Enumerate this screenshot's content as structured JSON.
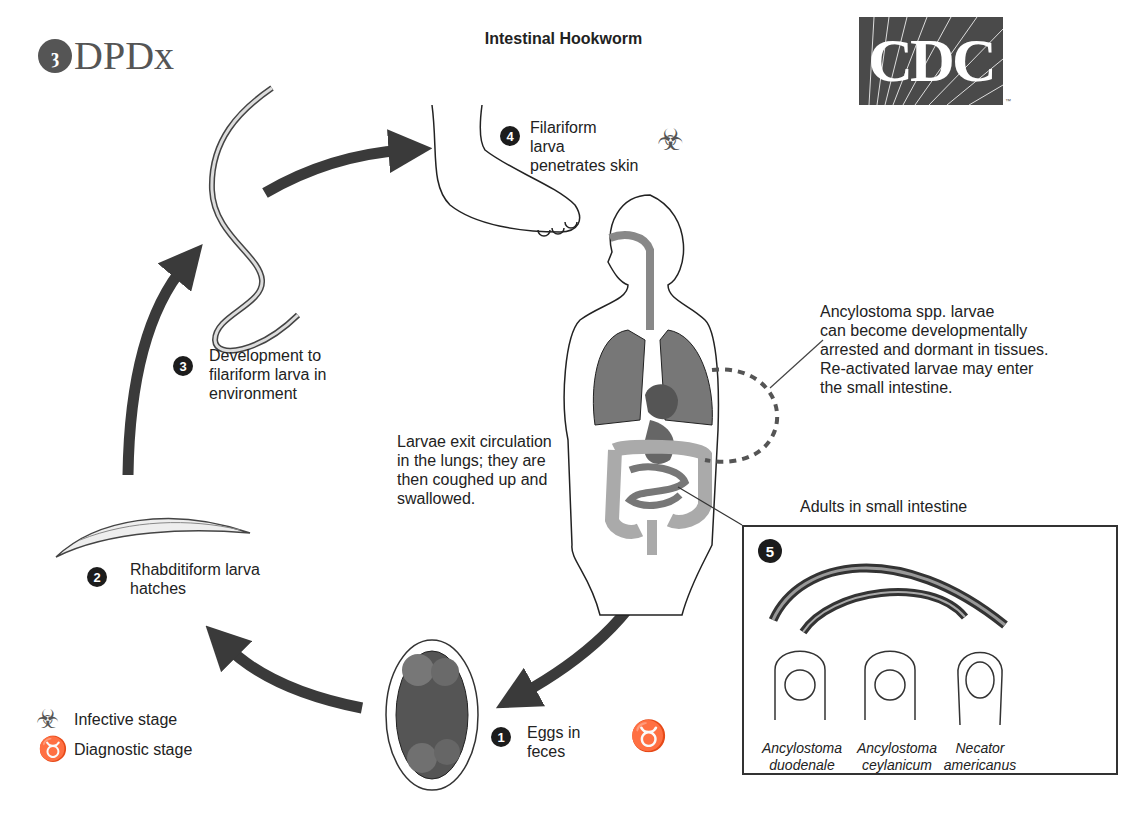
{
  "header": {
    "title": "Intestinal Hookworm",
    "left_logo": {
      "text": "DPDx",
      "icon": "microscope-icon"
    },
    "right_logo": {
      "text": "CDC",
      "trademark": "™"
    }
  },
  "stages": [
    {
      "number": "1",
      "label_lines": [
        "Eggs in",
        "feces"
      ],
      "stage_type": "diagnostic"
    },
    {
      "number": "2",
      "label_lines": [
        "Rhabditiform larva",
        "hatches"
      ]
    },
    {
      "number": "3",
      "label_lines": [
        "Development to",
        "filariform larva in",
        "environment"
      ]
    },
    {
      "number": "4",
      "label_lines": [
        "Filariform",
        "larva",
        "penetrates skin"
      ],
      "stage_type": "infective"
    },
    {
      "number": "5",
      "label": "Adults in small intestine"
    }
  ],
  "annotations": {
    "lungs": [
      "Larvae exit circulation",
      "in the lungs; they are",
      "then coughed up and",
      "swallowed."
    ],
    "ancylostoma": [
      "Ancylostoma spp. larvae",
      "can become developmentally",
      "arrested and dormant in tissues.",
      "Re-activated larvae may enter",
      "the small intestine."
    ]
  },
  "species": [
    {
      "genus": "Ancylostoma",
      "species": "duodenale"
    },
    {
      "genus": "Ancylostoma",
      "species": "ceylanicum"
    },
    {
      "genus": "Necator",
      "species": "americanus"
    }
  ],
  "legend": [
    {
      "icon": "biohazard-icon",
      "label": "Infective stage"
    },
    {
      "icon": "microscope-icon",
      "label": "Diagnostic stage"
    }
  ],
  "colors": {
    "arrow": "#3a3a3a",
    "organ_dark": "#777777",
    "organ_light": "#aaaaaa",
    "logo_bg": "#4a4a4a"
  }
}
